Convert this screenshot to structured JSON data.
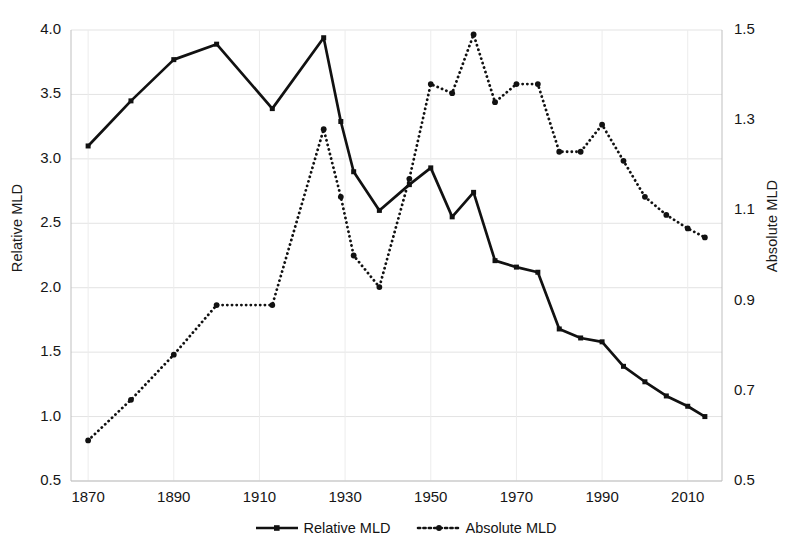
{
  "chart_data": {
    "type": "line",
    "title": "",
    "xlabel": "",
    "x": [
      1870,
      1880,
      1890,
      1900,
      1913,
      1925,
      1929,
      1932,
      1938,
      1945,
      1950,
      1955,
      1960,
      1965,
      1970,
      1975,
      1980,
      1985,
      1990,
      1995,
      2000,
      2005,
      2010,
      2014
    ],
    "xtick_labels": [
      "1870",
      "1890",
      "1910",
      "1930",
      "1950",
      "1970",
      "1990",
      "2010"
    ],
    "xticks": [
      1870,
      1890,
      1910,
      1930,
      1950,
      1970,
      1990,
      2010
    ],
    "xlim": [
      1866,
      2018
    ],
    "grid": true,
    "legend_position": "bottom-center",
    "series": [
      {
        "name": "Relative MLD",
        "axis": "left",
        "style": "solid",
        "marker": "square",
        "color": "#111111",
        "ylabel": "Relative MLD",
        "ylim": [
          0.5,
          4.0
        ],
        "ytick_labels": [
          "0.5",
          "1.0",
          "1.5",
          "2.0",
          "2.5",
          "3.0",
          "3.5",
          "4.0"
        ],
        "yticks": [
          0.5,
          1.0,
          1.5,
          2.0,
          2.5,
          3.0,
          3.5,
          4.0
        ],
        "values": [
          3.1,
          3.45,
          3.77,
          3.89,
          3.39,
          3.94,
          3.29,
          2.9,
          2.6,
          2.8,
          2.93,
          2.55,
          2.74,
          2.21,
          2.16,
          2.12,
          1.68,
          1.61,
          1.58,
          1.39,
          1.27,
          1.16,
          1.08,
          1.0
        ]
      },
      {
        "name": "Absolute MLD",
        "axis": "right",
        "style": "dotted",
        "marker": "circle",
        "color": "#111111",
        "ylabel": "Absolute MLD",
        "ylim": [
          0.5,
          1.5
        ],
        "ytick_labels": [
          "0.5",
          "0.7",
          "0.9",
          "1.1",
          "1.3",
          "1.5"
        ],
        "yticks": [
          0.5,
          0.7,
          0.9,
          1.1,
          1.3,
          1.5
        ],
        "values": [
          0.59,
          0.68,
          0.78,
          0.89,
          0.89,
          1.28,
          1.13,
          1.0,
          0.93,
          1.17,
          1.38,
          1.36,
          1.49,
          1.34,
          1.38,
          1.38,
          1.23,
          1.23,
          1.29,
          1.21,
          1.13,
          1.09,
          1.06,
          1.04
        ]
      }
    ]
  },
  "axes": {
    "left_title": "Relative MLD",
    "right_title": "Absolute MLD"
  },
  "legend": {
    "items": [
      {
        "label": "Relative MLD",
        "style": "solid-square"
      },
      {
        "label": "Absolute MLD",
        "style": "dotted-circle"
      }
    ]
  }
}
